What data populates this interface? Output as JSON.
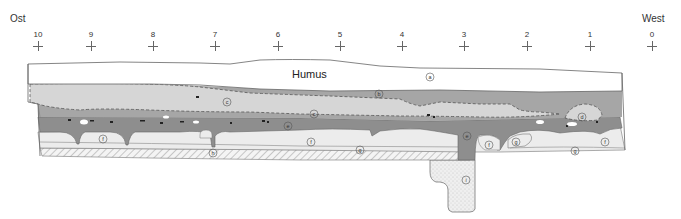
{
  "orientation": {
    "left": "Ost",
    "right": "West"
  },
  "scale_ticks": [
    {
      "label": "10",
      "x": 38
    },
    {
      "label": "9",
      "x": 91
    },
    {
      "label": "8",
      "x": 153
    },
    {
      "label": "7",
      "x": 215
    },
    {
      "label": "6",
      "x": 278
    },
    {
      "label": "5",
      "x": 340
    },
    {
      "label": "4",
      "x": 402
    },
    {
      "label": "3",
      "x": 464
    },
    {
      "label": "2",
      "x": 527
    },
    {
      "label": "1",
      "x": 590
    },
    {
      "label": "0",
      "x": 652
    }
  ],
  "layers": {
    "humus_label": "Humus",
    "markers": [
      {
        "id": "a",
        "label": "a",
        "x": 430,
        "y": 77
      },
      {
        "id": "b",
        "label": "b",
        "x": 379,
        "y": 94
      },
      {
        "id": "c",
        "label": "c",
        "x": 227,
        "y": 102
      },
      {
        "id": "c2",
        "label": "c",
        "x": 314,
        "y": 114
      },
      {
        "id": "d",
        "label": "d",
        "x": 582,
        "y": 117
      },
      {
        "id": "e",
        "label": "e",
        "x": 288,
        "y": 126
      },
      {
        "id": "e2",
        "label": "e",
        "x": 467,
        "y": 136
      },
      {
        "id": "f",
        "label": "f",
        "x": 103,
        "y": 139
      },
      {
        "id": "f2",
        "label": "f",
        "x": 311,
        "y": 142
      },
      {
        "id": "f3",
        "label": "f",
        "x": 489,
        "y": 145
      },
      {
        "id": "f4",
        "label": "f",
        "x": 605,
        "y": 142
      },
      {
        "id": "g",
        "label": "g",
        "x": 360,
        "y": 150
      },
      {
        "id": "g2",
        "label": "g",
        "x": 516,
        "y": 142
      },
      {
        "id": "g3",
        "label": "g",
        "x": 575,
        "y": 151
      },
      {
        "id": "h",
        "label": "h",
        "x": 213,
        "y": 153
      },
      {
        "id": "i",
        "label": "i",
        "x": 466,
        "y": 180
      }
    ]
  },
  "colors": {
    "humus": "#ffffff",
    "light_gray": "#d9d9d9",
    "mid_gray": "#a8a8a8",
    "dark_gray": "#8a8a8a",
    "pale": "#ececec",
    "outline": "#666666"
  }
}
